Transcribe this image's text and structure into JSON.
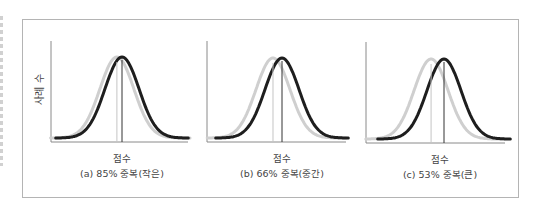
{
  "chart_data": [
    {
      "type": "line",
      "title": "(a) 85% 중복(작은)",
      "xlabel": "점수",
      "ylabel": "사례 수",
      "overlap_percent": 85,
      "effect_label": "작은",
      "distribution": "normal",
      "series": [
        {
          "name": "comparison",
          "color": "#cfcfcf",
          "mean": -0.3,
          "sd": 1
        },
        {
          "name": "treatment",
          "color": "#1e1e1e",
          "mean": 0,
          "sd": 1
        }
      ],
      "xlim": [
        -4.2,
        3.8
      ],
      "grid": false
    },
    {
      "type": "line",
      "title": "(b) 66% 중복(중간)",
      "xlabel": "점수",
      "ylabel": "",
      "overlap_percent": 66,
      "effect_label": "중간",
      "distribution": "normal",
      "series": [
        {
          "name": "comparison",
          "color": "#cfcfcf",
          "mean": -0.53,
          "sd": 1
        },
        {
          "name": "treatment",
          "color": "#1e1e1e",
          "mean": 0,
          "sd": 1
        }
      ],
      "xlim": [
        -4.4,
        3.7
      ],
      "grid": false
    },
    {
      "type": "line",
      "title": "(c) 53% 중복(큰)",
      "xlabel": "점수",
      "ylabel": "",
      "overlap_percent": 53,
      "effect_label": "큰",
      "distribution": "normal",
      "series": [
        {
          "name": "comparison",
          "color": "#cfcfcf",
          "mean": -0.76,
          "sd": 1
        },
        {
          "name": "treatment",
          "color": "#1e1e1e",
          "mean": 0,
          "sd": 1
        }
      ],
      "xlim": [
        -4.6,
        3.6
      ],
      "grid": false
    }
  ],
  "labels": {
    "ylabel": "사례 수",
    "xlabel": "점수",
    "captions": [
      "(a) 85% 중복(작은)",
      "(b) 66% 중복(중간)",
      "(c) 53% 중복(큰)"
    ]
  }
}
